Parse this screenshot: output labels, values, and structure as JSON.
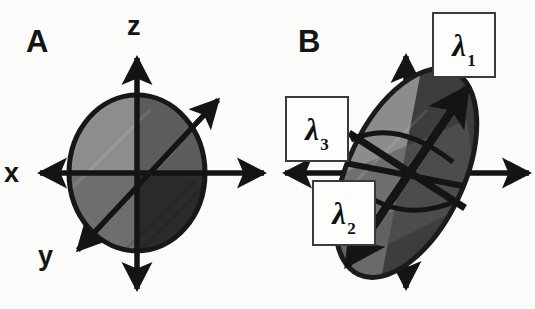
{
  "figure": {
    "width": 535,
    "height": 309,
    "background_color": "#fbfbf9",
    "ink_color": "#141414",
    "panels": [
      {
        "letter": "A",
        "name": "isotropic-sphere-panel",
        "description": "Isotropic diffusion sphere with cartesian x, y, z axes",
        "axis_labels": {
          "x": "x",
          "y": "y",
          "z": "z"
        },
        "shape": {
          "type": "sphere",
          "center": [
            137,
            173
          ],
          "radius_x": 68,
          "radius_y": 78,
          "outline_color": "#171717",
          "quadrant_colors": {
            "upper_left": "#8e8e8e",
            "upper_right": "#5a5a5a",
            "lower_left": "#6e6e6e",
            "lower_right": "#2a2a2a"
          }
        }
      },
      {
        "letter": "B",
        "name": "anisotropic-ellipsoid-panel",
        "description": "Anisotropic diffusion ellipsoid tilted, with three principal eigenvalue axes",
        "eigenvalue_labels": [
          {
            "id": "lambda1",
            "symbol": "λ",
            "subscript": "1"
          },
          {
            "id": "lambda2",
            "symbol": "λ",
            "subscript": "2"
          },
          {
            "id": "lambda3",
            "symbol": "λ",
            "subscript": "3"
          }
        ],
        "shape": {
          "type": "ellipsoid",
          "center": [
            139,
            173
          ],
          "semi_major": 112,
          "semi_minor": 58,
          "rotation_deg": -35,
          "outline_color": "#171717",
          "fill_light": "#8b8b8b",
          "fill_dark": "#3a3a3a"
        }
      }
    ]
  }
}
